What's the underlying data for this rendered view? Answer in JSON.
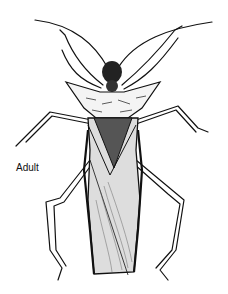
{
  "figure": {
    "label": "Adult",
    "ink_color": "#111111",
    "background": "#ffffff"
  }
}
